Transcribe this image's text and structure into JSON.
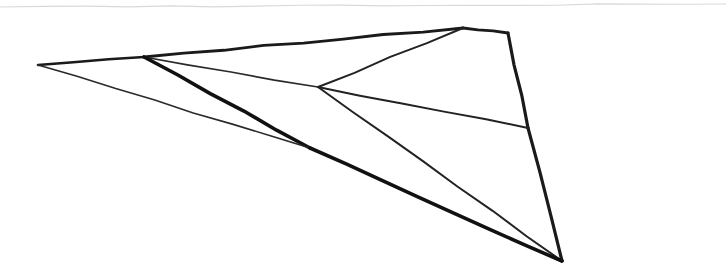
{
  "image": {
    "kind": "scanned-line-drawing",
    "title": "Hand-drawn wireframe polyhedron sketch",
    "width": 726,
    "height": 272,
    "background_color": "#ffffff",
    "ink_color": "#1a1a1a",
    "artifact_color": "#d9d9d9"
  },
  "figure": {
    "name": "wireframe-polyhedron",
    "vertices": [
      {
        "id": "left-tip",
        "label": "Left tip",
        "x": 38,
        "y": 65
      },
      {
        "id": "top-branch",
        "label": "Top edge branch point",
        "x": 144,
        "y": 57
      },
      {
        "id": "center-hub",
        "label": "Central four-way junction",
        "x": 318,
        "y": 87
      },
      {
        "id": "lower-knee",
        "label": "Lower-left convergence knee",
        "x": 310,
        "y": 148
      },
      {
        "id": "top-apex",
        "label": "Top apex",
        "x": 463,
        "y": 28
      },
      {
        "id": "top-right-corner",
        "label": "Top-right corner",
        "x": 508,
        "y": 33
      },
      {
        "id": "right-mid-junction",
        "label": "Right-edge junction",
        "x": 528,
        "y": 128
      },
      {
        "id": "bottom-vertex",
        "label": "Bottom vertex",
        "x": 562,
        "y": 261
      }
    ],
    "edges": [
      {
        "id": "edge-top-left-a",
        "label": "Top edge, tip to branch",
        "from": "left-tip",
        "to": "top-branch",
        "weight": 2.6,
        "shade": "#1a1a1a"
      },
      {
        "id": "edge-top-left-b",
        "label": "Top edge, branch to apex",
        "from": "top-branch",
        "to": "top-apex",
        "weight": 2.8,
        "shade": "#1a1a1a"
      },
      {
        "id": "edge-apex-corner",
        "label": "Apex to top-right corner",
        "from": "top-apex",
        "to": "top-right-corner",
        "weight": 2.8,
        "shade": "#1a1a1a"
      },
      {
        "id": "edge-right-upper",
        "label": "Right edge upper segment",
        "from": "top-right-corner",
        "to": "right-mid-junction",
        "weight": 3.2,
        "shade": "#1a1a1a"
      },
      {
        "id": "edge-right-lower",
        "label": "Right edge lower segment",
        "from": "right-mid-junction",
        "to": "bottom-vertex",
        "weight": 3.2,
        "shade": "#1a1a1a"
      },
      {
        "id": "edge-hub-apex",
        "label": "Hub to apex diagonal",
        "from": "center-hub",
        "to": "top-apex",
        "weight": 2.0,
        "shade": "#222222"
      },
      {
        "id": "edge-hub-right",
        "label": "Hub to right-edge junction",
        "from": "center-hub",
        "to": "right-mid-junction",
        "weight": 2.0,
        "shade": "#222222"
      },
      {
        "id": "edge-branch-hub",
        "label": "Branch point to hub",
        "from": "top-branch",
        "to": "center-hub",
        "weight": 1.7,
        "shade": "#2a2a2a"
      },
      {
        "id": "edge-hub-bottom",
        "label": "Hub to bottom vertex",
        "from": "center-hub",
        "to": "bottom-vertex",
        "weight": 2.0,
        "shade": "#222222"
      },
      {
        "id": "edge-branch-knee",
        "label": "Branch point to lower knee (heavy)",
        "from": "top-branch",
        "to": "lower-knee",
        "weight": 3.6,
        "shade": "#111111"
      },
      {
        "id": "edge-tip-knee",
        "label": "Tip to lower knee (thin)",
        "from": "left-tip",
        "to": "lower-knee",
        "weight": 1.6,
        "shade": "#2a2a2a"
      },
      {
        "id": "edge-knee-bottom",
        "label": "Lower knee to bottom vertex (heavy)",
        "from": "lower-knee",
        "to": "bottom-vertex",
        "weight": 3.6,
        "shade": "#111111"
      }
    ],
    "artifacts": [
      {
        "id": "scan-line-top",
        "label": "Faint horizontal scan line near top",
        "x1": 0,
        "y1": 7,
        "x2": 726,
        "y2": 4,
        "weight": 1.2,
        "shade": "#d9d9d9"
      }
    ]
  }
}
